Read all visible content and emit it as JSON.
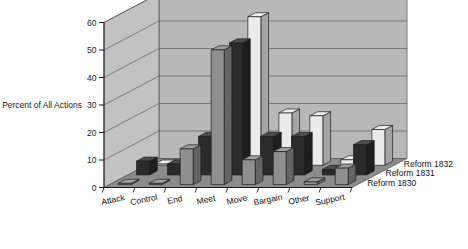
{
  "chart_data": {
    "type": "bar",
    "title": "",
    "subtitle": "",
    "xlabel": "",
    "ylabel": "Percent of All Actions",
    "ylim": [
      0,
      60
    ],
    "yticks": [
      0,
      10,
      20,
      30,
      40,
      50,
      60
    ],
    "ytick_labels": [
      "0",
      "10",
      "20",
      "30",
      "40",
      "50",
      "60"
    ],
    "grid": true,
    "grid_axis": "y",
    "legend_position": "right-bottom-inline",
    "projection": "3d",
    "categories": [
      "Attack",
      "Control",
      "End",
      "Meet",
      "Move",
      "Bargain",
      "Other",
      "Support"
    ],
    "series": [
      {
        "name": "Reform 1830",
        "color": "#8f8f8f",
        "values": [
          0,
          0,
          13,
          49,
          9,
          12,
          1,
          6
        ]
      },
      {
        "name": "Reform 1831",
        "color": "#2b2b2b",
        "values": [
          5,
          4,
          14,
          48,
          14,
          14,
          2,
          11
        ]
      },
      {
        "name": "Reform 1832",
        "color": "#ebebeb",
        "values": [
          0,
          0,
          15,
          54,
          19,
          18,
          2,
          13
        ]
      }
    ],
    "annotations": []
  },
  "axis": {
    "y_title": "Percent of All Actions",
    "tick_labels": [
      "60",
      "50",
      "40",
      "30",
      "20",
      "10",
      "0"
    ]
  },
  "categories": {
    "labels": [
      "Attack",
      "Control",
      "End",
      "Meet",
      "Move",
      "Bargain",
      "Other",
      "Support"
    ]
  },
  "legend": {
    "items": [
      {
        "label": "Reform 1832"
      },
      {
        "label": "Reform 1831"
      },
      {
        "label": "Reform 1830"
      }
    ]
  },
  "colors": {
    "wall_back": "#b8b8b8",
    "wall_side": "#c2c2c2",
    "floor": "#8c8c8c",
    "gridline": "#5a5a5a",
    "bar_series_1": "#8f8f8f",
    "bar_series_2": "#2b2b2b",
    "bar_series_3": "#ebebeb",
    "bar_outline": "#1c1c1c",
    "text": "#111111"
  }
}
